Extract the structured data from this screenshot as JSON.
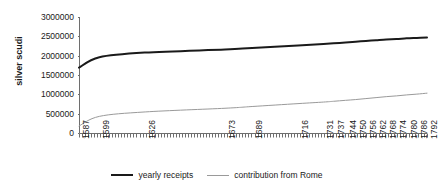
{
  "chart_data": {
    "type": "line",
    "title": "",
    "xlabel": "",
    "ylabel": "silver scudi",
    "ylim": [
      0,
      3000000
    ],
    "y_ticks": [
      "3000000",
      "2500000",
      "2000000",
      "1500000",
      "1000000",
      "500000",
      "0"
    ],
    "y_tick_values": [
      3000000,
      2500000,
      2000000,
      1500000,
      1000000,
      500000,
      0
    ],
    "grid": false,
    "legend_position": "bottom",
    "x_tick_labels": [
      "1587",
      "1599",
      "1626",
      "1673",
      "1689",
      "1716",
      "1731",
      "1737",
      "1744",
      "1750",
      "1756",
      "1762",
      "1768",
      "1774",
      "1780",
      "1786",
      "1792"
    ],
    "x": [
      1587,
      1599,
      1626,
      1673,
      1689,
      1716,
      1731,
      1737,
      1744,
      1750,
      1756,
      1762,
      1768,
      1774,
      1780,
      1786,
      1792
    ],
    "series": [
      {
        "name": "yearly  receipts",
        "color": "#1a1a1a",
        "width": 2,
        "values": [
          1690000,
          1960000,
          2080000,
          2160000,
          2200000,
          2260000,
          2300000,
          2320000,
          2340000,
          2360000,
          2380000,
          2400000,
          2420000,
          2430000,
          2450000,
          2460000,
          2470000
        ]
      },
      {
        "name": "contribution from Rome",
        "color": "#9a9a9a",
        "width": 1,
        "values": [
          180000,
          430000,
          545000,
          640000,
          685000,
          760000,
          800000,
          820000,
          845000,
          865000,
          890000,
          915000,
          940000,
          960000,
          985000,
          1005000,
          1030000
        ]
      }
    ]
  },
  "axis": {
    "y_title": "silver scudi"
  },
  "legend": {
    "items": [
      {
        "label": "yearly  receipts",
        "color": "#1a1a1a",
        "weight": "thick"
      },
      {
        "label": "contribution from Rome",
        "color": "#9a9a9a",
        "weight": "thin"
      }
    ]
  }
}
